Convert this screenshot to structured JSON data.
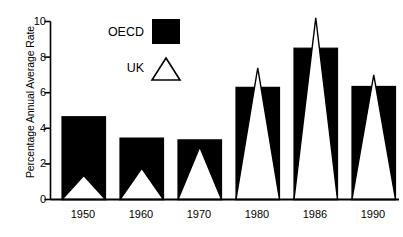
{
  "chart_data": {
    "type": "bar",
    "title": "",
    "xlabel": "",
    "ylabel": "Percentage Annual Average Rate",
    "categories": [
      "1950",
      "1960",
      "1970",
      "1980",
      "1986",
      "1990"
    ],
    "ylim": [
      0,
      10
    ],
    "yticks": [
      0,
      2,
      4,
      6,
      8,
      10
    ],
    "ytick_labels": [
      "0",
      "2",
      "4",
      "6",
      "8",
      "10"
    ],
    "grid": false,
    "legend_position": "upper-left-inside",
    "series": [
      {
        "name": "OECD",
        "marker": "filled-square",
        "color": "#000000",
        "values": [
          4.65,
          3.45,
          3.35,
          6.3,
          8.5,
          6.35
        ]
      },
      {
        "name": "UK",
        "marker": "outlined-triangle",
        "color": "#ffffff",
        "values": [
          1.35,
          1.75,
          2.95,
          7.4,
          10.2,
          7.0
        ]
      }
    ]
  },
  "axis": {
    "y_title": "Percentage Annual Average Rate",
    "y_tick_labels": [
      "10",
      "8",
      "6",
      "4",
      "2",
      "0"
    ],
    "x_tick_labels": [
      "1950",
      "1960",
      "1970",
      "1980",
      "1986",
      "1990"
    ]
  },
  "legend": {
    "entries": [
      {
        "label": "OECD",
        "swatch": "filled-square-swatch"
      },
      {
        "label": "UK",
        "swatch": "outlined-triangle-swatch"
      }
    ]
  }
}
